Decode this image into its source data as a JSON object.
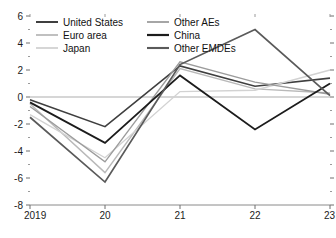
{
  "chart_data": {
    "type": "line",
    "title": "",
    "subtitle": "",
    "xlabel": "",
    "ylabel": "",
    "x": [
      "2019",
      "20",
      "21",
      "22",
      "23"
    ],
    "xtick_labels": [
      "2019",
      "20",
      "21",
      "22",
      "23"
    ],
    "ytick_labels": [
      "6",
      "4",
      "2",
      "0",
      "-2",
      "-4",
      "-6",
      "-8"
    ],
    "ytick_values": [
      6,
      4,
      2,
      0,
      -2,
      -4,
      -6,
      -8
    ],
    "yminor_values": [
      5,
      3,
      1,
      -1,
      -3,
      -5,
      -7
    ],
    "ylim": [
      -8,
      6
    ],
    "xlim": [
      2019,
      2023
    ],
    "grid": false,
    "zero_line": true,
    "legend_position": "top-left",
    "series": [
      {
        "name": "United States",
        "color": "#3f3f3f",
        "width": 1.6,
        "values": [
          -0.2,
          -2.2,
          2.3,
          0.8,
          1.4
        ]
      },
      {
        "name": "Euro area",
        "color": "#b9b9b9",
        "width": 1.4,
        "values": [
          -0.5,
          -5.6,
          2.1,
          0.6,
          0.3
        ]
      },
      {
        "name": "Japan",
        "color": "#d2d2d2",
        "width": 1.4,
        "values": [
          -1.3,
          -4.5,
          0.4,
          0.5,
          2.0
        ]
      },
      {
        "name": "Other AEs",
        "color": "#9c9c9c",
        "width": 1.4,
        "values": [
          -0.7,
          -4.8,
          2.6,
          1.1,
          0.2
        ]
      },
      {
        "name": "China",
        "color": "#1c1c1c",
        "width": 1.8,
        "values": [
          -0.4,
          -3.4,
          1.6,
          -2.4,
          1.0
        ]
      },
      {
        "name": "Other EMDEs",
        "color": "#5a5a5a",
        "width": 1.7,
        "values": [
          -1.5,
          -6.3,
          2.4,
          5.0,
          0.1
        ]
      }
    ]
  },
  "legend": {
    "entries": [
      {
        "label": "United States"
      },
      {
        "label": "Other AEs"
      },
      {
        "label": "Euro area"
      },
      {
        "label": "China"
      },
      {
        "label": "Japan"
      },
      {
        "label": "Other EMDEs"
      }
    ]
  },
  "axes": {
    "y_axis_name": "y-axis",
    "x_axis_name": "x-axis"
  }
}
